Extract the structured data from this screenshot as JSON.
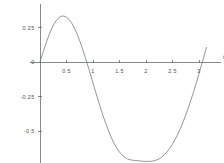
{
  "chart_data": {
    "type": "line",
    "title": "",
    "subtitle": "",
    "xlabel": "t",
    "ylabel": "",
    "xlim": [
      -0.18,
      3.42
    ],
    "ylim": [
      -0.86,
      0.42
    ],
    "grid": false,
    "legend": false,
    "legend_position": "none",
    "xticks": [
      0.5,
      1,
      1.5,
      2,
      2.5,
      3
    ],
    "xticklabels": [
      "0.5",
      "1",
      "1.5",
      "2",
      "2.5",
      "3"
    ],
    "yticks": [
      0.25,
      0,
      -0.25,
      -0.5
    ],
    "yticklabels": [
      "0.25",
      "0",
      "-0.25",
      "-0.5"
    ],
    "origin_label": "0",
    "series": [
      {
        "name": "curve",
        "color": "#6e7478",
        "x": [
          0.0,
          0.05,
          0.1,
          0.15,
          0.2,
          0.25,
          0.3,
          0.35,
          0.4,
          0.45,
          0.5,
          0.55,
          0.6,
          0.65,
          0.7,
          0.75,
          0.8,
          0.85,
          0.9,
          0.95,
          1.0,
          1.05,
          1.1,
          1.15,
          1.2,
          1.25,
          1.3,
          1.35,
          1.4,
          1.45,
          1.5,
          1.55,
          1.6,
          1.65,
          1.7,
          1.75,
          1.8,
          1.85,
          1.9,
          1.95,
          2.0,
          2.05,
          2.1,
          2.15,
          2.2,
          2.25,
          2.3,
          2.35,
          2.4,
          2.45,
          2.5,
          2.55,
          2.6,
          2.65,
          2.7,
          2.75,
          2.8,
          2.85,
          2.9,
          2.95,
          3.0,
          3.05,
          3.1,
          3.14
        ],
        "y": [
          0.0,
          0.061,
          0.12,
          0.175,
          0.224,
          0.265,
          0.297,
          0.319,
          0.331,
          0.333,
          0.325,
          0.307,
          0.28,
          0.245,
          0.202,
          0.153,
          0.098,
          0.039,
          -0.023,
          -0.087,
          -0.152,
          -0.217,
          -0.281,
          -0.342,
          -0.401,
          -0.455,
          -0.506,
          -0.551,
          -0.591,
          -0.625,
          -0.653,
          -0.675,
          -0.691,
          -0.702,
          -0.708,
          -0.712,
          -0.714,
          -0.716,
          -0.718,
          -0.719,
          -0.72,
          -0.72,
          -0.719,
          -0.716,
          -0.71,
          -0.701,
          -0.688,
          -0.671,
          -0.65,
          -0.625,
          -0.595,
          -0.561,
          -0.523,
          -0.481,
          -0.434,
          -0.384,
          -0.33,
          -0.273,
          -0.213,
          -0.15,
          -0.085,
          -0.018,
          0.05,
          0.105
        ],
        "peak": {
          "x": 0.45,
          "y": 0.333
        },
        "trough": {
          "x": 2.05,
          "y": -0.72
        },
        "zero_crossing": 0.87
      }
    ]
  }
}
